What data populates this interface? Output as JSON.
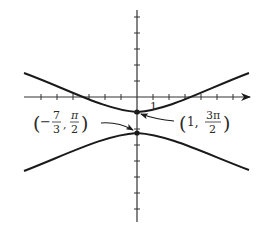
{
  "figure": {
    "colors": {
      "curve": "#1a1a1a",
      "axis": "#333333",
      "text": "#2a2a2a",
      "background": "#ffffff"
    },
    "axes": {
      "x_tick_label": "1"
    },
    "annotations": [
      {
        "id": "lower-vertex",
        "open": "(",
        "sign": "−",
        "frac1_num": "7",
        "frac1_den": "3",
        "comma": ",",
        "frac2_num": "π",
        "frac2_den": "2",
        "close": ")"
      },
      {
        "id": "upper-vertex",
        "open": "(",
        "value1": "1,",
        "frac2_num": "3π",
        "frac2_den": "2",
        "close": ")"
      }
    ]
  }
}
